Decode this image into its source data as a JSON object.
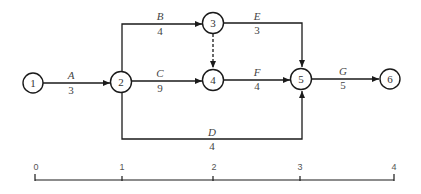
{
  "diagram": {
    "type": "activity-on-arrow network",
    "nodes": [
      {
        "id": "1",
        "label": "1"
      },
      {
        "id": "2",
        "label": "2"
      },
      {
        "id": "3",
        "label": "3"
      },
      {
        "id": "4",
        "label": "4"
      },
      {
        "id": "5",
        "label": "5"
      },
      {
        "id": "6",
        "label": "6"
      }
    ],
    "activities": [
      {
        "name": "A",
        "duration": "3",
        "from": "1",
        "to": "2"
      },
      {
        "name": "B",
        "duration": "4",
        "from": "2",
        "to": "3"
      },
      {
        "name": "C",
        "duration": "9",
        "from": "2",
        "to": "4"
      },
      {
        "name": "D",
        "duration": "4",
        "from": "2",
        "to": "5"
      },
      {
        "name": "E",
        "duration": "3",
        "from": "3",
        "to": "5"
      },
      {
        "name": "F",
        "duration": "4",
        "from": "4",
        "to": "5"
      },
      {
        "name": "G",
        "duration": "5",
        "from": "5",
        "to": "6"
      }
    ],
    "dummy_activities": [
      {
        "from": "3",
        "to": "4",
        "style": "dashed"
      }
    ],
    "time_axis": {
      "ticks": [
        "0",
        "1",
        "2",
        "3",
        "4"
      ]
    }
  }
}
